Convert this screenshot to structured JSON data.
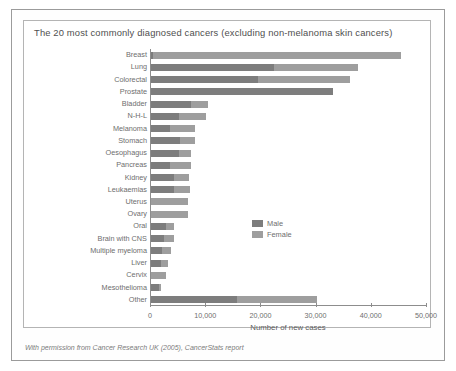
{
  "figure": {
    "title": "The 20 most commonly diagnosed cancers (excluding non-melanoma skin cancers)",
    "footer": "With permission from Cancer Research UK (2005), CancerStats report"
  },
  "legend": {
    "male_label": "Male",
    "female_label": "Female",
    "male_color": "#7d7d7d",
    "female_color": "#9e9e9e"
  },
  "chart_data": {
    "type": "bar",
    "orientation": "horizontal",
    "stacked": true,
    "title": "The 20 most commonly diagnosed cancers (excluding non-melanoma skin cancers)",
    "xlabel": "Number of new cases",
    "ylabel": "",
    "xlim": [
      0,
      50000
    ],
    "xticks": [
      0,
      10000,
      20000,
      30000,
      40000,
      50000
    ],
    "xticklabels": [
      "0",
      "10,000",
      "20,000",
      "30,000",
      "40,000",
      "50,000"
    ],
    "grid": false,
    "legend_position": "lower right",
    "categories": [
      "Breast",
      "Lung",
      "Colorectal",
      "Prostate",
      "Bladder",
      "N-H-L",
      "Melanoma",
      "Stomach",
      "Oesophagus",
      "Pancreas",
      "Kidney",
      "Leukaemias",
      "Uterus",
      "Ovary",
      "Oral",
      "Brain with CNS",
      "Multiple myeloma",
      "Liver",
      "Cervix",
      "Mesothelioma",
      "Other"
    ],
    "series": [
      {
        "name": "Male",
        "color": "#7d7d7d",
        "values": [
          300,
          22200,
          19300,
          33000,
          7200,
          5000,
          3500,
          5200,
          5000,
          3500,
          4200,
          4100,
          0,
          0,
          2700,
          2400,
          2000,
          1900,
          0,
          1500,
          15500
        ]
      },
      {
        "name": "Female",
        "color": "#9e9e9e",
        "values": [
          45000,
          15300,
          16700,
          0,
          3100,
          4900,
          4500,
          2800,
          2300,
          3700,
          2600,
          3000,
          6700,
          6700,
          1500,
          1800,
          1700,
          1200,
          2800,
          300,
          14500
        ]
      }
    ],
    "totals": [
      45300,
      37500,
      36000,
      33000,
      10300,
      9900,
      8000,
      8000,
      7300,
      7200,
      6800,
      7100,
      6700,
      6700,
      4200,
      4200,
      3700,
      3100,
      2800,
      1800,
      30000
    ]
  }
}
